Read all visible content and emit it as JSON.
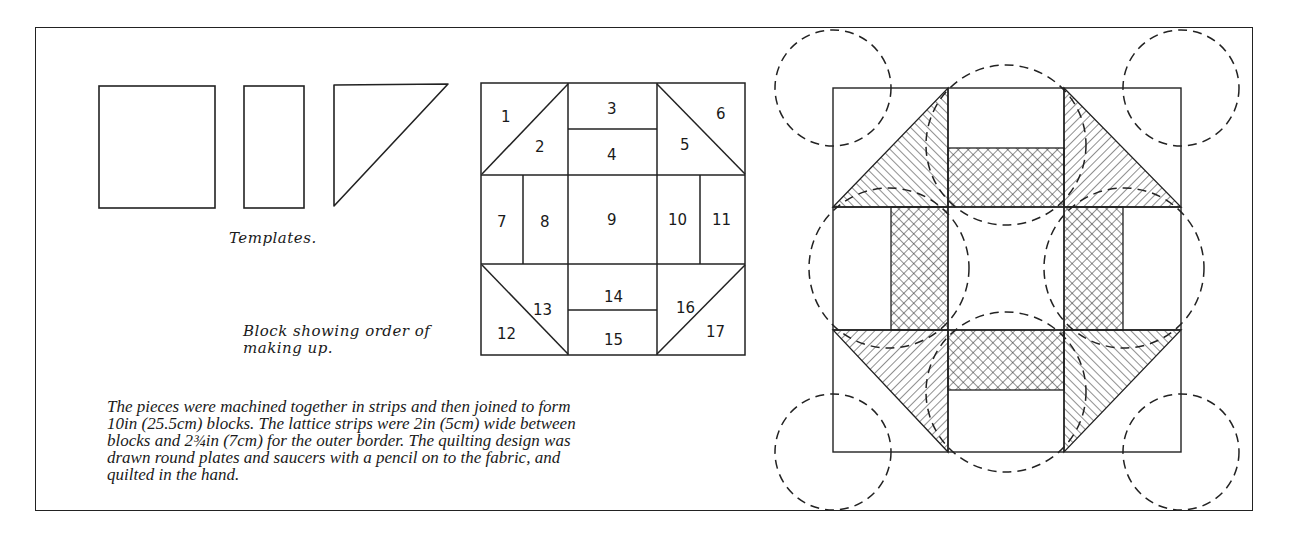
{
  "captions": {
    "templates": "Templates.",
    "block_order": [
      "Block showing order of",
      "making up."
    ]
  },
  "description": {
    "lines": [
      "The pieces were machined together in strips and then joined to form",
      "10in (25.5cm) blocks. The lattice strips were 2in (5cm) wide between",
      "blocks and 2¾in (7cm) for the outer border. The quilting design was",
      "drawn round plates and saucers with a pencil on to the fabric, and",
      "quilted in the hand."
    ]
  },
  "templates": [
    {
      "shape": "square"
    },
    {
      "shape": "rectangle"
    },
    {
      "shape": "triangle"
    }
  ],
  "block_pieces": {
    "p1": "1",
    "p2": "2",
    "p3": "3",
    "p4": "4",
    "p5": "5",
    "p6": "6",
    "p7": "7",
    "p8": "8",
    "p9": "9",
    "p10": "10",
    "p11": "11",
    "p12": "12",
    "p13": "13",
    "p14": "14",
    "p15": "15",
    "p16": "16",
    "p17": "17"
  },
  "quilt_illustration": {
    "patterns": {
      "triangles": "diagonal-hatch",
      "strips": "cross-hatch",
      "center": "plain"
    },
    "quilting": "dashed circles (plates and saucers)"
  }
}
